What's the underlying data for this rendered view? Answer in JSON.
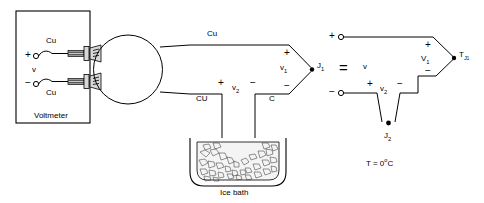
{
  "diagram": {
    "equals_sign": "=",
    "left_circuit": {
      "instrument_label": "Voltmeter",
      "instrument_polarity_plus": "+",
      "instrument_polarity_minus": "−",
      "instrument_voltage_label": "v",
      "lead_upper_material": "Cu",
      "lead_lower_material": "Cu",
      "top_conductor_label": "Cu",
      "lower_left_conductor_label": "CU",
      "lower_right_conductor_label": "C",
      "v1_label": "v",
      "v1_subscript": "1",
      "v1_plus": "+",
      "v1_minus": "−",
      "v2_label": "v",
      "v2_subscript": "2",
      "v2_plus": "+",
      "v2_minus": "−",
      "junction_j1_label": "J",
      "junction_j1_subscript": "1",
      "ice_bath_label": "Ice bath"
    },
    "right_circuit": {
      "source_voltage_label": "v",
      "terminal_plus": "+",
      "terminal_minus": "−",
      "V1_label": "V",
      "V1_subscript": "1",
      "V1_plus": "+",
      "V1_minus": "−",
      "v2_label": "v",
      "v2_subscript": "2",
      "v2_plus": "+",
      "v2_minus": "−",
      "junction_tj1_label": "T",
      "junction_tj1_subscript": "J",
      "junction_tj1_subsubscript": "1",
      "junction_j2_label": "J",
      "junction_j2_subscript": "2",
      "temperature_label": "T = 0",
      "temperature_degree": "o",
      "temperature_unit": "C"
    },
    "colors": {
      "line": "#000000",
      "background": "#ffffff",
      "ice_fill": "#f4f4f4",
      "post_metal": "#d8d8d8"
    }
  }
}
